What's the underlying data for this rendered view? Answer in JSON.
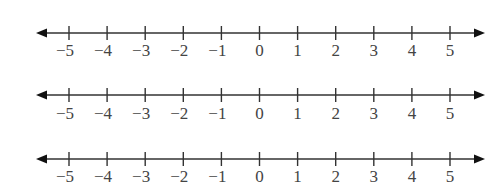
{
  "diagram": {
    "type": "number-lines",
    "count": 3,
    "colors": {
      "line": "#333333",
      "arrow": "#111111",
      "label": "#444444",
      "background": "#ffffff"
    },
    "lines": [
      {
        "y": 33,
        "label_y": 56,
        "ticks": [
          -5,
          -4,
          -3,
          -2,
          -1,
          0,
          1,
          2,
          3,
          4,
          5
        ],
        "labels": [
          "−5",
          "−4",
          "−3",
          "−2",
          "−1",
          "0",
          "1",
          "2",
          "3",
          "4",
          "5"
        ]
      },
      {
        "y": 95,
        "label_y": 119,
        "ticks": [
          -5,
          -4,
          -3,
          -2,
          -1,
          0,
          1,
          2,
          3,
          4,
          5
        ],
        "labels": [
          "−5",
          "−4",
          "−3",
          "−2",
          "−1",
          "0",
          "1",
          "2",
          "3",
          "4",
          "5"
        ]
      },
      {
        "y": 159,
        "label_y": 182,
        "ticks": [
          -5,
          -4,
          -3,
          -2,
          -1,
          0,
          1,
          2,
          3,
          4,
          5
        ],
        "labels": [
          "−5",
          "−4",
          "−3",
          "−2",
          "−1",
          "0",
          "1",
          "2",
          "3",
          "4",
          "5"
        ]
      }
    ],
    "x_start": 36,
    "x_end": 485,
    "tick_x0": 69,
    "tick_spacing": 38.1
  }
}
